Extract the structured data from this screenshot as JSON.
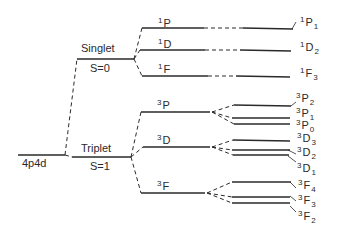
{
  "diagram": {
    "type": "energy-level-splitting",
    "configuration": {
      "label": "4p4d"
    },
    "spin_states": [
      {
        "name": "Singlet",
        "spin": "S=0"
      },
      {
        "name": "Triplet",
        "spin": "S=1"
      }
    ],
    "terms": [
      {
        "mult": "1",
        "L": "P"
      },
      {
        "mult": "1",
        "L": "D"
      },
      {
        "mult": "1",
        "L": "F"
      },
      {
        "mult": "3",
        "L": "P"
      },
      {
        "mult": "3",
        "L": "D"
      },
      {
        "mult": "3",
        "L": "F"
      }
    ],
    "levels": [
      {
        "mult": "1",
        "L": "P",
        "J": "1"
      },
      {
        "mult": "1",
        "L": "D",
        "J": "2"
      },
      {
        "mult": "1",
        "L": "F",
        "J": "3"
      },
      {
        "mult": "3",
        "L": "P",
        "J": "2"
      },
      {
        "mult": "3",
        "L": "P",
        "J": "1"
      },
      {
        "mult": "3",
        "L": "P",
        "J": "0"
      },
      {
        "mult": "3",
        "L": "D",
        "J": "3"
      },
      {
        "mult": "3",
        "L": "D",
        "J": "2"
      },
      {
        "mult": "3",
        "L": "D",
        "J": "1"
      },
      {
        "mult": "3",
        "L": "F",
        "J": "4"
      },
      {
        "mult": "3",
        "L": "F",
        "J": "3"
      },
      {
        "mult": "3",
        "L": "F",
        "J": "2"
      }
    ]
  }
}
